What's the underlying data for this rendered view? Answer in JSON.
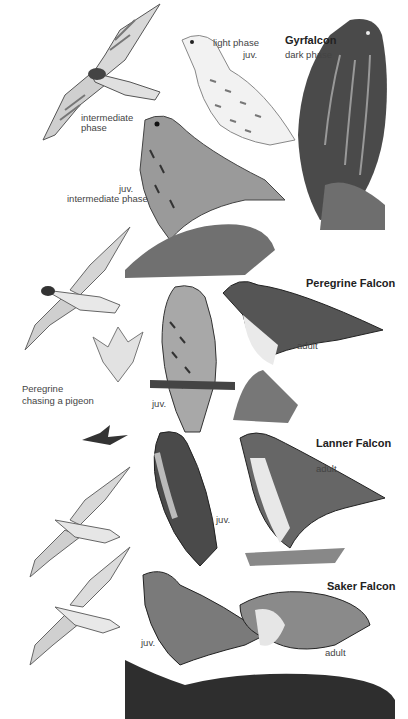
{
  "plate": {
    "type": "field guide illustration plate",
    "subject": "Large falcons"
  },
  "species": [
    {
      "name": "Gyrfalcon",
      "labels": [
        "light phase",
        "juv.",
        "dark phase",
        "intermediate phase",
        "juv.",
        "intermediate phase"
      ]
    },
    {
      "name": "Peregrine Falcon",
      "labels": [
        "adult",
        "juv.",
        "Peregrine",
        "chasing a pigeon"
      ]
    },
    {
      "name": "Lanner Falcon",
      "labels": [
        "adult",
        "juv."
      ]
    },
    {
      "name": "Saker Falcon",
      "labels": [
        "juv.",
        "adult"
      ]
    }
  ],
  "text": {
    "gyr_title": "Gyrfalcon",
    "gyr_light": "light phase",
    "gyr_light_juv": "juv.",
    "gyr_dark": "dark phase",
    "gyr_flight_inter_1": "intermediate",
    "gyr_flight_inter_2": "phase",
    "gyr_juv": "juv.",
    "gyr_juv_inter": "intermediate phase",
    "per_title": "Peregrine Falcon",
    "per_adult": "adult",
    "per_juv": "juv.",
    "per_chase_1": "Peregrine",
    "per_chase_2": "chasing a pigeon",
    "lan_title": "Lanner Falcon",
    "lan_adult": "adult",
    "lan_juv": "juv.",
    "sak_title": "Saker Falcon",
    "sak_juv": "juv.",
    "sak_adult": "adult"
  },
  "colors": {
    "background": "#ffffff",
    "ink_dark": "#2a2a2a",
    "ink_mid": "#6e6e6e",
    "ink_light": "#bdbdbd",
    "rock": "#7a7a7a"
  }
}
